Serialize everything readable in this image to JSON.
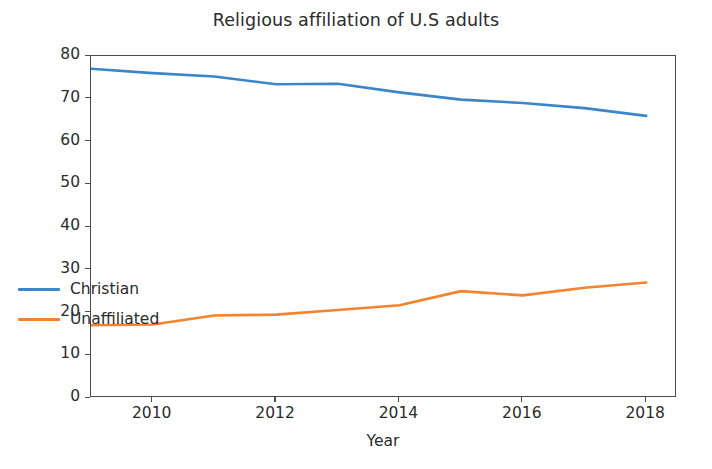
{
  "chart_data": {
    "type": "line",
    "title": "Religious affiliation of U.S adults",
    "xlabel": "Year",
    "ylabel": "% of adults",
    "xlim": [
      2009,
      2018.5
    ],
    "ylim": [
      0,
      80
    ],
    "grid": false,
    "legend_position": "lower left",
    "xticks": [
      "2010",
      "2012",
      "2014",
      "2016",
      "2018"
    ],
    "xtick_values": [
      2010,
      2012,
      2014,
      2016,
      2018
    ],
    "yticks": [
      "0",
      "10",
      "20",
      "30",
      "40",
      "50",
      "60",
      "70",
      "80"
    ],
    "ytick_values": [
      0,
      10,
      20,
      30,
      40,
      50,
      60,
      70,
      80
    ],
    "x": [
      2009,
      2010,
      2011,
      2012,
      2013,
      2014,
      2015,
      2016,
      2017,
      2018
    ],
    "series": [
      {
        "name": "Christian",
        "color": "#3b85c8",
        "values": [
          77.0,
          76.0,
          75.2,
          73.4,
          73.5,
          71.5,
          69.8,
          69.0,
          67.8,
          66.0
        ]
      },
      {
        "name": "Unaffiliated",
        "color": "#f5822e",
        "values": [
          17.0,
          17.2,
          19.3,
          19.5,
          20.6,
          21.7,
          25.0,
          24.0,
          25.8,
          27.0
        ]
      }
    ]
  },
  "axes": {
    "frame_color": "#4a4a52",
    "tick_color": "#4a4a52"
  }
}
